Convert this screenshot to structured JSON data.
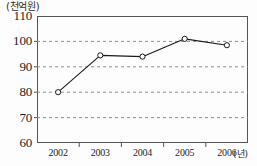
{
  "chart_data": {
    "type": "line",
    "title": "",
    "subtitle": "",
    "ylabel": "(천억원)",
    "xlabel": "(년)",
    "categories": [
      "2002",
      "2003",
      "2004",
      "2005",
      "2006"
    ],
    "x": [
      2002,
      2003,
      2004,
      2005,
      2006
    ],
    "values": [
      80,
      94.5,
      94,
      101,
      98.5
    ],
    "series": [
      {
        "name": "",
        "values": [
          80,
          94.5,
          94,
          101,
          98.5
        ]
      }
    ],
    "ylim": [
      60,
      110
    ],
    "yticks": [
      60,
      70,
      80,
      90,
      100,
      110
    ],
    "ytick_labels": [
      "60",
      "70",
      "80",
      "90",
      "100",
      "110"
    ],
    "xtick_labels": [
      "2002",
      "2003",
      "2004",
      "2005",
      "2006"
    ],
    "grid": "horizontal-dashed",
    "legend": "none",
    "marker": "open-circle",
    "line_color": "#1a1a1a",
    "marker_fill": "#ffffff",
    "marker_stroke": "#1a1a1a",
    "grid_color": "#8f8f93",
    "frame_color": "#55555a",
    "background_color": "#fdfdfd"
  },
  "axes": {
    "y_unit_caption": "(천억원)",
    "x_unit_caption": "(년)"
  }
}
